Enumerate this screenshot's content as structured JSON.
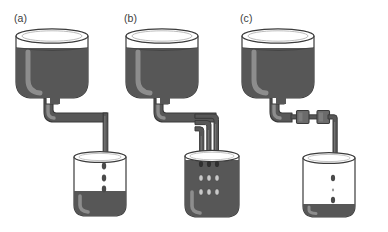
{
  "figure": {
    "type": "diagram",
    "background_color": "#ffffff",
    "stroke_color": "#3b3b3b",
    "panel_count": 3
  },
  "colors": {
    "liquid_dark": "#575757",
    "liquid_shadow": "#4a4a4a",
    "highlight": "#8d8d8d",
    "outline": "#3b3b3b",
    "empty_glass": "#ffffff",
    "droplet": "#4a4a4a",
    "droplet_light": "#c9c9c9",
    "valve_block": "#6b6b6b",
    "tube": "#575757"
  },
  "panels": [
    {
      "id": "a",
      "label": "(a)",
      "reservoir": {
        "name": "funnel-reservoir",
        "fill_level": "high",
        "headspace_label": "air-gap",
        "liquid_color": "#575757"
      },
      "conduit": {
        "name": "single-tube",
        "tube_count": 1,
        "valves": 0,
        "shape": "down-right-down"
      },
      "receiver": {
        "name": "receiving-beaker",
        "fill_level": "low",
        "droplets": 3,
        "droplet_arrangement": "single-column"
      }
    },
    {
      "id": "b",
      "label": "(b)",
      "reservoir": {
        "name": "funnel-reservoir",
        "fill_level": "high",
        "headspace_label": "air-gap",
        "liquid_color": "#575757"
      },
      "conduit": {
        "name": "triple-parallel-tubes",
        "tube_count": 3,
        "valves": 0,
        "shape": "down-right-split-down"
      },
      "receiver": {
        "name": "receiving-beaker",
        "fill_level": "full",
        "droplets": 9,
        "droplet_arrangement": "three-by-three-grid"
      }
    },
    {
      "id": "c",
      "label": "(c)",
      "reservoir": {
        "name": "funnel-reservoir",
        "fill_level": "high",
        "headspace_label": "air-gap",
        "liquid_color": "#575757"
      },
      "conduit": {
        "name": "tube-with-restrictors",
        "tube_count": 1,
        "valves": 2,
        "valve_name": "restrictor-block",
        "shape": "down-right-valve-valve-down"
      },
      "receiver": {
        "name": "receiving-beaker",
        "fill_level": "very-low",
        "droplets": 3,
        "droplet_arrangement": "sparse-column"
      }
    }
  ]
}
